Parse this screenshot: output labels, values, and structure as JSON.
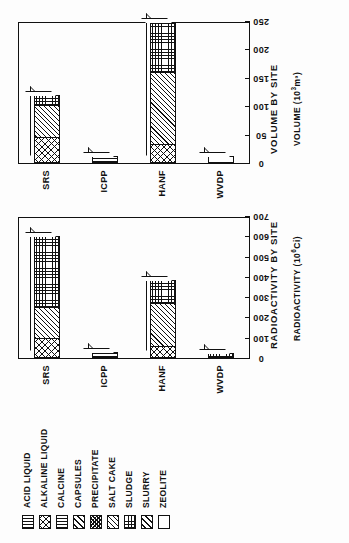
{
  "figure": {
    "orientation": "rotated-90-ccw",
    "legend": {
      "name": "waste-form-legend",
      "items": [
        {
          "label": "ACID LIQUID",
          "pattern": "vertical-lines"
        },
        {
          "label": "ALKALINE LIQUID",
          "pattern": "x-cross-coarse"
        },
        {
          "label": "CALCINE",
          "pattern": "vertical-lines-wide"
        },
        {
          "label": "CAPSULES",
          "pattern": "diagonal-single"
        },
        {
          "label": "PRECIPITATE",
          "pattern": "x-cross-dense"
        },
        {
          "label": "SALT CAKE",
          "pattern": "diagonal-dense"
        },
        {
          "label": "SLUDGE",
          "pattern": "grid"
        },
        {
          "label": "SLURRY",
          "pattern": "diagonal-wide"
        },
        {
          "label": "ZEOLITE",
          "pattern": "blank"
        }
      ]
    }
  },
  "chart_data": [
    {
      "id": "radioactivity",
      "type": "bar",
      "stacked": true,
      "orientation": "vertical",
      "title": "RADIOACTIVITY BY SITE",
      "xlabel": "",
      "ylabel": "RADIOACTIVITY (10⁶Ci)",
      "ylabel_base": "RADIOACTIVITY (10",
      "ylabel_exp": "6",
      "ylabel_tail": "Ci)",
      "categories": [
        "SRS",
        "ICPP",
        "HANF",
        "WVDP"
      ],
      "ylim": [
        0,
        700
      ],
      "yticks": [
        0,
        100,
        200,
        300,
        400,
        500,
        600,
        700
      ],
      "grid": false,
      "series": [
        {
          "name": "ACID LIQUID",
          "values": [
            0,
            30,
            0,
            0
          ]
        },
        {
          "name": "ALKALINE LIQUID",
          "values": [
            100,
            0,
            60,
            0
          ]
        },
        {
          "name": "CALCINE",
          "values": [
            0,
            0,
            0,
            0
          ]
        },
        {
          "name": "CAPSULES",
          "values": [
            0,
            0,
            0,
            0
          ]
        },
        {
          "name": "PRECIPITATE",
          "values": [
            0,
            0,
            0,
            0
          ]
        },
        {
          "name": "SALT CAKE",
          "values": [
            150,
            0,
            210,
            0
          ]
        },
        {
          "name": "SLUDGE",
          "values": [
            350,
            0,
            115,
            25
          ]
        },
        {
          "name": "SLURRY",
          "values": [
            0,
            0,
            0,
            0
          ]
        },
        {
          "name": "ZEOLITE",
          "values": [
            0,
            0,
            0,
            0
          ]
        }
      ],
      "totals": [
        600,
        30,
        385,
        25
      ]
    },
    {
      "id": "volume",
      "type": "bar",
      "stacked": true,
      "orientation": "vertical",
      "title": "VOLUME BY SITE",
      "xlabel": "",
      "ylabel": "VOLUME (10³m³)",
      "ylabel_base": "VOLUME (10",
      "ylabel_exp": "3",
      "ylabel_tail": "m³)",
      "categories": [
        "SRS",
        "ICPP",
        "HANF",
        "WVDP"
      ],
      "ylim": [
        0,
        250
      ],
      "yticks": [
        0,
        50,
        100,
        150,
        200,
        250
      ],
      "grid": false,
      "series": [
        {
          "name": "ACID LIQUID",
          "values": [
            0,
            13,
            0,
            0
          ]
        },
        {
          "name": "ALKALINE LIQUID",
          "values": [
            46,
            0,
            33,
            0
          ]
        },
        {
          "name": "CALCINE",
          "values": [
            0,
            0,
            0,
            0
          ]
        },
        {
          "name": "CAPSULES",
          "values": [
            0,
            0,
            0,
            0
          ]
        },
        {
          "name": "PRECIPITATE",
          "values": [
            0,
            0,
            0,
            0
          ]
        },
        {
          "name": "SALT CAKE",
          "values": [
            56,
            0,
            127,
            0
          ]
        },
        {
          "name": "SLUDGE",
          "values": [
            18,
            0,
            88,
            0
          ]
        },
        {
          "name": "SLURRY",
          "values": [
            0,
            0,
            0,
            0
          ]
        },
        {
          "name": "ZEOLITE",
          "values": [
            0,
            0,
            0,
            12
          ]
        }
      ],
      "totals": [
        120,
        13,
        248,
        12
      ]
    }
  ]
}
